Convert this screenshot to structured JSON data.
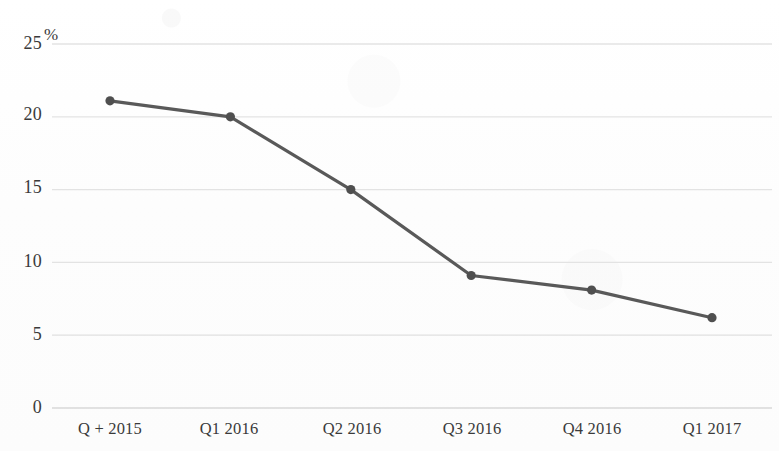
{
  "chart_data": {
    "type": "line",
    "title": "",
    "subtitle": "",
    "xlabel": "",
    "ylabel": "",
    "unit_label": "%",
    "categories": [
      "Q + 2015",
      "Q1 2016",
      "Q2 2016",
      "Q3 2016",
      "Q4 2016",
      "Q1 2017"
    ],
    "values": [
      21.1,
      20.0,
      15.0,
      9.1,
      8.1,
      6.2
    ],
    "series": [
      {
        "name": "",
        "values": [
          21.1,
          20.0,
          15.0,
          9.1,
          8.1,
          6.2
        ]
      }
    ],
    "ylim": [
      0,
      25
    ],
    "yticks": [
      0,
      5,
      10,
      15,
      20,
      25
    ],
    "ytick_labels": [
      "0",
      "5",
      "10",
      "15",
      "20",
      "25"
    ],
    "xtick_labels": [
      "Q + 2015",
      "Q1 2016",
      "Q2 2016",
      "Q3 2016",
      "Q4 2016",
      "Q1 2017"
    ],
    "grid": true,
    "grid_axis": "y",
    "legend": false,
    "legend_position": "none",
    "markers": true,
    "line_color": "#595959",
    "marker_color": "#4f4f4f",
    "grid_color": "#e2e2e2",
    "text_color": "#3a3a3a",
    "background_color": "#fdfdfd",
    "annotations": []
  },
  "axes": {
    "y": {
      "ticks": [
        {
          "label": "25",
          "value": 25,
          "suffix": "%"
        },
        {
          "label": "20",
          "value": 20,
          "suffix": ""
        },
        {
          "label": "15",
          "value": 15,
          "suffix": ""
        },
        {
          "label": "10",
          "value": 10,
          "suffix": ""
        },
        {
          "label": "5",
          "value": 5,
          "suffix": ""
        },
        {
          "label": "0",
          "value": 0,
          "suffix": ""
        }
      ]
    },
    "x": {
      "ticks": [
        {
          "label": "Q + 2015"
        },
        {
          "label": "Q1 2016"
        },
        {
          "label": "Q2 2016"
        },
        {
          "label": "Q3 2016"
        },
        {
          "label": "Q4 2016"
        },
        {
          "label": "Q1 2017"
        }
      ]
    }
  }
}
